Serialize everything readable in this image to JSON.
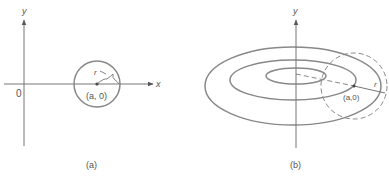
{
  "panels": [
    {
      "id": "a",
      "caption": "(a)",
      "axis_y_label": "y",
      "axis_x_label": "x",
      "origin_label": "0",
      "center_label": "(a, 0)",
      "radius_label": "r"
    },
    {
      "id": "b",
      "caption": "(b)",
      "axis_y_label": "y",
      "center_label": "(a,0)",
      "radius_label": "r"
    }
  ],
  "colors": {
    "stroke": "#777777",
    "axis": "#666666",
    "text": "#555555",
    "background": "#ffffff"
  }
}
